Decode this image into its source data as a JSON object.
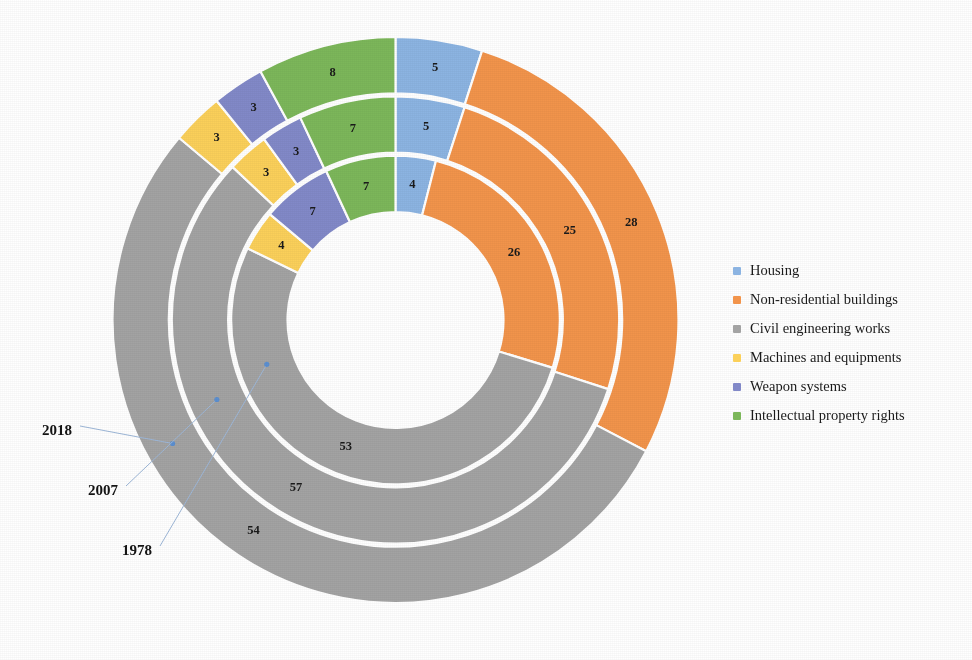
{
  "chart_data": {
    "type": "pie",
    "subtype": "multi-ring donut (sunburst by year)",
    "title": "",
    "xlabel": "",
    "ylabel": "",
    "legend_position": "right",
    "grid": false,
    "value_unit": "percent",
    "start_angle_deg": 0,
    "direction": "clockwise",
    "categories": [
      "Housing",
      "Non-residential buildings",
      "Civil engineering works",
      "Machines and equipments",
      "Weapon systems",
      "Intellectual property rights"
    ],
    "ring_order_inner_to_outer": [
      "1978",
      "2007",
      "2018"
    ],
    "series": [
      {
        "name": "1978",
        "ring": "inner",
        "values": [
          4,
          26,
          53,
          4,
          7,
          7
        ]
      },
      {
        "name": "2007",
        "ring": "middle",
        "values": [
          5,
          25,
          57,
          3,
          3,
          7
        ]
      },
      {
        "name": "2018",
        "ring": "outer",
        "values": [
          5,
          28,
          54,
          3,
          3,
          8
        ]
      }
    ],
    "colors": {
      "Housing": "#8cb4e2",
      "Non-residential buildings": "#f2944b",
      "Civil engineering works": "#a3a3a3",
      "Machines and equipments": "#fbd05a",
      "Weapon systems": "#8289c8",
      "Intellectual property rights": "#7cb75a"
    }
  },
  "legend": {
    "items": [
      {
        "label": "Housing",
        "color": "#8cb4e2"
      },
      {
        "label": "Non-residential buildings",
        "color": "#f2944b"
      },
      {
        "label": "Civil engineering works",
        "color": "#a3a3a3"
      },
      {
        "label": "Machines and equipments",
        "color": "#fbd05a"
      },
      {
        "label": "Weapon systems",
        "color": "#8289c8"
      },
      {
        "label": "Intellectual property rights",
        "color": "#7cb75a"
      }
    ]
  },
  "annotations": {
    "year_callouts": [
      {
        "label": "2018",
        "ring": "outer"
      },
      {
        "label": "2007",
        "ring": "middle"
      },
      {
        "label": "1978",
        "ring": "inner"
      }
    ]
  }
}
